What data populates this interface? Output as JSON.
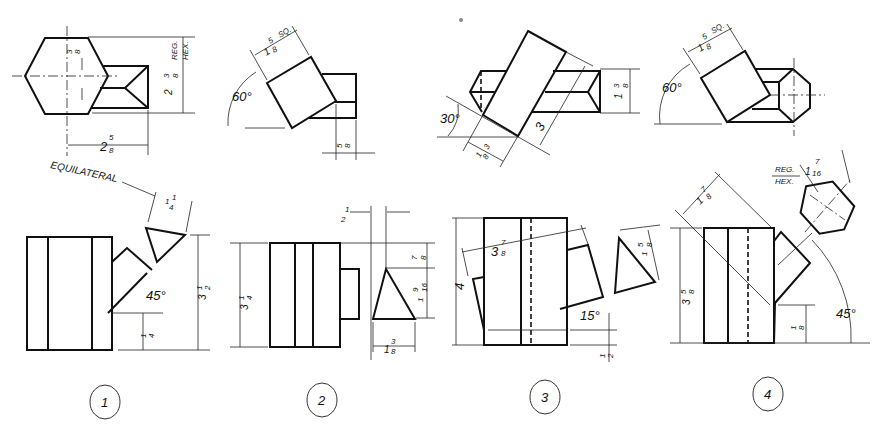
{
  "figure": {
    "problems": [
      {
        "number": "1",
        "top_view": {
          "labels": [
            "REG.",
            "HEX."
          ],
          "dimensions": {
            "hex_width": "2 3/8",
            "offset": "3/8",
            "length": "2 5/8"
          }
        },
        "front_view": {
          "note": "EQUILATERAL",
          "dimensions": {
            "triangle_side": "1 1/4",
            "height": "3 1/2",
            "bottom_offset": "1/4",
            "angle": "45°"
          }
        }
      },
      {
        "number": "2",
        "top_view": {
          "dimensions": {
            "square": "1 5/8 SQ.",
            "angle": "60°",
            "prism_width": "5/8"
          }
        },
        "front_view": {
          "dimensions": {
            "height": "3 1/4",
            "offset": "1/2",
            "top_gap": "7/8",
            "triangle_height": "1 9/16",
            "triangle_base": "1 3/8"
          }
        }
      },
      {
        "number": "3",
        "top_view": {
          "dimensions": {
            "angle": "30°",
            "width": "1 3/8",
            "length": "3",
            "prism_height": "1 3/8"
          }
        },
        "front_view": {
          "dimensions": {
            "height": "4",
            "slant": "3 7/8",
            "triangle": "1 5/8",
            "angle": "15°",
            "bottom_offset": "1/2"
          }
        }
      },
      {
        "number": "4",
        "top_view": {
          "dimensions": {
            "square": "1 5/8 SQ.",
            "angle": "60°"
          }
        },
        "front_view": {
          "labels": [
            "REG.",
            "HEX."
          ],
          "dimensions": {
            "hex_across": "1 7/16",
            "slant": "1 7/8",
            "height": "3 5/8",
            "bottom_offset": "1/8",
            "angle": "45°"
          }
        }
      }
    ]
  },
  "labels": {
    "p1": {
      "reg": "REG.",
      "hex": "HEX.",
      "d_238_w": "2",
      "d_238_f": "3",
      "d_238_d": "8",
      "d_38_n": "3",
      "d_38_d": "8",
      "d_258_w": "2",
      "d_258_n": "5",
      "d_258_d": "8",
      "equilateral": "EQUILATERAL",
      "d_114_w": "1",
      "d_114_n": "1",
      "d_114_d": "4",
      "d_312_w": "3",
      "d_312_n": "1",
      "d_312_d": "2",
      "d_45": "45°",
      "d_14_n": "1",
      "d_14_d": "4",
      "num": "1"
    },
    "p2": {
      "sq": "SQ.",
      "d_158_w": "1",
      "d_158_n": "5",
      "d_158_d": "8",
      "d_60": "60°",
      "d_58_n": "5",
      "d_58_d": "8",
      "d_12_n": "1",
      "d_12_d": "2",
      "d_314_w": "3",
      "d_314_n": "1",
      "d_314_d": "4",
      "d_78_n": "7",
      "d_78_d": "8",
      "d_1916_w": "1",
      "d_1916_n": "9",
      "d_1916_d": "16",
      "d_138_w": "1",
      "d_138_n": "3",
      "d_138_d": "8",
      "num": "2"
    },
    "p3": {
      "d_30": "30°",
      "d_138a_w": "1",
      "d_138a_n": "3",
      "d_138a_d": "8",
      "d_3": "3",
      "d_138b_w": "1",
      "d_138b_n": "3",
      "d_138b_d": "8",
      "d_4": "4",
      "d_378_w": "3",
      "d_378_n": "7",
      "d_378_d": "8",
      "d_158_w": "1",
      "d_158_n": "5",
      "d_158_d": "8",
      "d_15": "15°",
      "d_12_n": "1",
      "d_12_d": "2",
      "num": "3"
    },
    "p4": {
      "sq": "SQ.",
      "d_158_w": "1",
      "d_158_n": "5",
      "d_158_d": "8",
      "d_60": "60°",
      "reg": "REG.",
      "hex": "HEX.",
      "d_1716_w": "1",
      "d_1716_n": "7",
      "d_1716_d": "16",
      "d_178_w": "1",
      "d_178_n": "7",
      "d_178_d": "8",
      "d_358_w": "3",
      "d_358_n": "5",
      "d_358_d": "8",
      "d_18_n": "1",
      "d_18_d": "8",
      "d_45": "45°",
      "num": "4"
    }
  },
  "colors": {
    "ink": "#111111",
    "paper": "#ffffff"
  }
}
